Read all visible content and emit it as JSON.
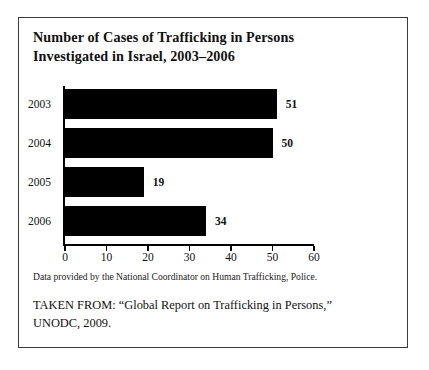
{
  "figure": {
    "title_lines": [
      "Number of Cases of Trafficking in Persons",
      "Investigated in Israel, 2003–2006"
    ],
    "data_note": "Data provided by the National Coordinator on Human Trafficking, Police.",
    "source_lines": [
      "TAKEN FROM: “Global Report on Trafficking in Persons,”",
      "UNODC, 2009."
    ],
    "border_color": "#3a3a3a",
    "bar_color": "#000000",
    "background_color": "#ffffff"
  },
  "chart_data": {
    "type": "bar",
    "orientation": "horizontal",
    "title": "Number of Cases of Trafficking in Persons Investigated in Israel, 2003–2006",
    "categories": [
      "2003",
      "2004",
      "2005",
      "2006"
    ],
    "values": [
      51,
      50,
      19,
      34
    ],
    "value_labels": [
      "51",
      "50",
      "19",
      "34"
    ],
    "xlabel": "",
    "ylabel": "",
    "xlim": [
      0,
      60
    ],
    "xticks": [
      0,
      10,
      20,
      30,
      40,
      50,
      60
    ],
    "xtick_labels": [
      "0",
      "10",
      "20",
      "30",
      "40",
      "50",
      "60"
    ],
    "grid": false,
    "legend": false,
    "series_color": "#000000"
  }
}
